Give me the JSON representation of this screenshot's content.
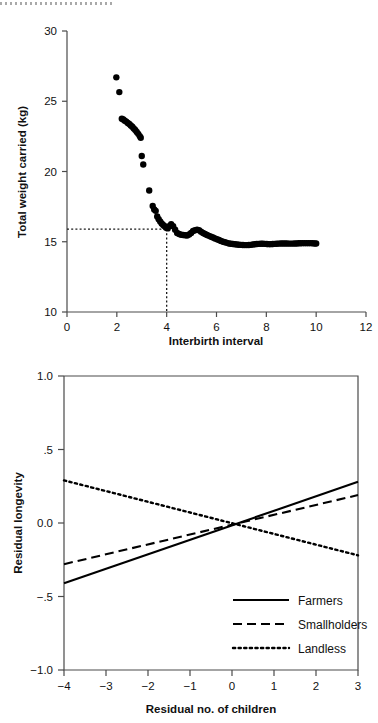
{
  "page": {
    "background": "#ffffff",
    "ink": "#111111",
    "axis_color": "#4a4a4a"
  },
  "artifact": {
    "name": "scan-edge-dotted-line"
  },
  "chart_data": [
    {
      "id": "scatter-weight-vs-interbirth",
      "type": "scatter",
      "title": "",
      "xlabel": "Interbirth interval",
      "ylabel": "Total weight carried (kg)",
      "xlim": [
        0,
        12
      ],
      "ylim": [
        10,
        30
      ],
      "xticks": [
        0,
        2,
        4,
        6,
        8,
        10,
        12
      ],
      "xticklabels": [
        "0",
        "2",
        "4",
        "6",
        "8",
        "10",
        "12"
      ],
      "yticks": [
        10,
        15,
        20,
        25,
        30
      ],
      "yticklabels": [
        "10",
        "15",
        "20",
        "25",
        "30"
      ],
      "grid": false,
      "legend": "none",
      "annotations": [
        {
          "name": "optimum-reference-lines",
          "type": "dotted-crosshair",
          "x": 4.0,
          "y": 15.9
        }
      ],
      "points": [
        [
          1.98,
          26.7
        ],
        [
          2.1,
          25.65
        ],
        [
          2.2,
          23.75
        ],
        [
          2.26,
          23.7
        ],
        [
          2.32,
          23.62
        ],
        [
          2.38,
          23.55
        ],
        [
          2.44,
          23.46
        ],
        [
          2.5,
          23.38
        ],
        [
          2.56,
          23.28
        ],
        [
          2.62,
          23.18
        ],
        [
          2.68,
          23.06
        ],
        [
          2.74,
          22.95
        ],
        [
          2.8,
          22.82
        ],
        [
          2.86,
          22.68
        ],
        [
          2.92,
          22.52
        ],
        [
          2.96,
          22.4
        ],
        [
          3.0,
          21.1
        ],
        [
          3.06,
          20.5
        ],
        [
          3.3,
          18.65
        ],
        [
          3.44,
          17.55
        ],
        [
          3.5,
          17.3
        ],
        [
          3.56,
          17.2
        ],
        [
          3.62,
          16.8
        ],
        [
          3.68,
          16.6
        ],
        [
          3.74,
          16.45
        ],
        [
          3.8,
          16.3
        ],
        [
          3.86,
          16.2
        ],
        [
          3.92,
          16.1
        ],
        [
          3.98,
          16.0
        ],
        [
          4.04,
          15.95
        ],
        [
          4.1,
          16.1
        ],
        [
          4.18,
          16.25
        ],
        [
          4.26,
          16.1
        ],
        [
          4.34,
          15.85
        ],
        [
          4.42,
          15.62
        ],
        [
          4.5,
          15.55
        ],
        [
          4.58,
          15.5
        ],
        [
          4.66,
          15.48
        ],
        [
          4.74,
          15.46
        ],
        [
          4.82,
          15.45
        ],
        [
          4.9,
          15.52
        ],
        [
          4.98,
          15.62
        ],
        [
          5.06,
          15.76
        ],
        [
          5.14,
          15.82
        ],
        [
          5.22,
          15.86
        ],
        [
          5.3,
          15.82
        ],
        [
          5.38,
          15.72
        ],
        [
          5.46,
          15.62
        ],
        [
          5.54,
          15.55
        ],
        [
          5.62,
          15.48
        ],
        [
          5.7,
          15.42
        ],
        [
          5.78,
          15.36
        ],
        [
          5.86,
          15.3
        ],
        [
          5.94,
          15.24
        ],
        [
          6.02,
          15.18
        ],
        [
          6.1,
          15.12
        ],
        [
          6.18,
          15.06
        ],
        [
          6.26,
          15.0
        ],
        [
          6.34,
          14.96
        ],
        [
          6.42,
          14.92
        ],
        [
          6.5,
          14.88
        ],
        [
          6.58,
          14.86
        ],
        [
          6.66,
          14.84
        ],
        [
          6.74,
          14.82
        ],
        [
          6.82,
          14.8
        ],
        [
          6.9,
          14.79
        ],
        [
          6.98,
          14.78
        ],
        [
          7.06,
          14.77
        ],
        [
          7.14,
          14.76
        ],
        [
          7.22,
          14.76
        ],
        [
          7.3,
          14.77
        ],
        [
          7.38,
          14.78
        ],
        [
          7.46,
          14.8
        ],
        [
          7.54,
          14.82
        ],
        [
          7.62,
          14.84
        ],
        [
          7.7,
          14.85
        ],
        [
          7.78,
          14.86
        ],
        [
          7.86,
          14.86
        ],
        [
          7.94,
          14.85
        ],
        [
          8.02,
          14.84
        ],
        [
          8.1,
          14.83
        ],
        [
          8.18,
          14.83
        ],
        [
          8.26,
          14.84
        ],
        [
          8.34,
          14.85
        ],
        [
          8.42,
          14.86
        ],
        [
          8.5,
          14.87
        ],
        [
          8.58,
          14.88
        ],
        [
          8.66,
          14.88
        ],
        [
          8.74,
          14.88
        ],
        [
          8.82,
          14.88
        ],
        [
          8.9,
          14.87
        ],
        [
          8.98,
          14.87
        ],
        [
          9.06,
          14.87
        ],
        [
          9.14,
          14.88
        ],
        [
          9.22,
          14.88
        ],
        [
          9.3,
          14.89
        ],
        [
          9.38,
          14.89
        ],
        [
          9.46,
          14.9
        ],
        [
          9.54,
          14.9
        ],
        [
          9.62,
          14.9
        ],
        [
          9.7,
          14.9
        ],
        [
          9.78,
          14.9
        ],
        [
          9.86,
          14.89
        ],
        [
          9.94,
          14.88
        ],
        [
          10.0,
          14.88
        ]
      ]
    },
    {
      "id": "lines-longevity-vs-children",
      "type": "line",
      "title": "",
      "xlabel": "Residual no. of children",
      "ylabel": "Residual longevity",
      "xlim": [
        -4,
        3
      ],
      "ylim": [
        -1.0,
        1.0
      ],
      "xticks": [
        -4,
        -3,
        -2,
        -1,
        0,
        1,
        2,
        3
      ],
      "xticklabels": [
        "−4",
        "−3",
        "−2",
        "−1",
        "0",
        "1",
        "2",
        "3"
      ],
      "yticks": [
        -1.0,
        -0.5,
        0.0,
        0.5,
        1.0
      ],
      "yticklabels": [
        "−1.0",
        "−.5",
        "0.0",
        ".5",
        "1.0"
      ],
      "grid": false,
      "legend": "inside-lower-right",
      "series": [
        {
          "name": "Farmers",
          "style": "solid",
          "x": [
            -4,
            3
          ],
          "values": [
            -0.41,
            0.28
          ]
        },
        {
          "name": "Smallholders",
          "style": "dashed",
          "x": [
            -4,
            3
          ],
          "values": [
            -0.28,
            0.19
          ]
        },
        {
          "name": "Landless",
          "style": "dotted",
          "x": [
            -4,
            3
          ],
          "values": [
            0.29,
            -0.22
          ]
        }
      ]
    }
  ]
}
